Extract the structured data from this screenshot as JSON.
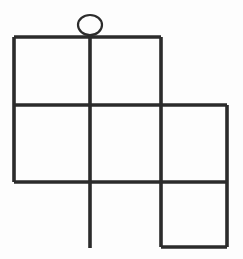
{
  "canvas": {
    "width": 243,
    "height": 259,
    "background_color": "#fdfdfd"
  },
  "figure": {
    "name": "grid-line-drawing-with-ellipse",
    "stroke_color": "#2b2b2b",
    "line_thickness": 3.6,
    "ellipse_thickness": 2.2,
    "segments": [
      {
        "id": "top-horizontal-line",
        "x1": 14,
        "y1": 37,
        "x2": 161,
        "y2": 37
      },
      {
        "id": "middle-horizontal-line",
        "x1": 14,
        "y1": 105,
        "x2": 227,
        "y2": 105
      },
      {
        "id": "lower-horizontal-line",
        "x1": 14,
        "y1": 182,
        "x2": 227,
        "y2": 182
      },
      {
        "id": "bottom-right-horizontal-line",
        "x1": 161,
        "y1": 247,
        "x2": 227,
        "y2": 247
      },
      {
        "id": "left-vertical-line",
        "x1": 14,
        "y1": 37,
        "x2": 14,
        "y2": 182
      },
      {
        "id": "center-vertical-line",
        "x1": 90,
        "y1": 37,
        "x2": 90,
        "y2": 248
      },
      {
        "id": "right-vertical-line",
        "x1": 161,
        "y1": 37,
        "x2": 161,
        "y2": 247
      },
      {
        "id": "far-right-vertical-line",
        "x1": 227,
        "y1": 105,
        "x2": 227,
        "y2": 247
      }
    ],
    "ellipse": {
      "id": "head-ellipse",
      "cx": 90,
      "cy": 25,
      "rx": 12,
      "ry": 10
    }
  }
}
